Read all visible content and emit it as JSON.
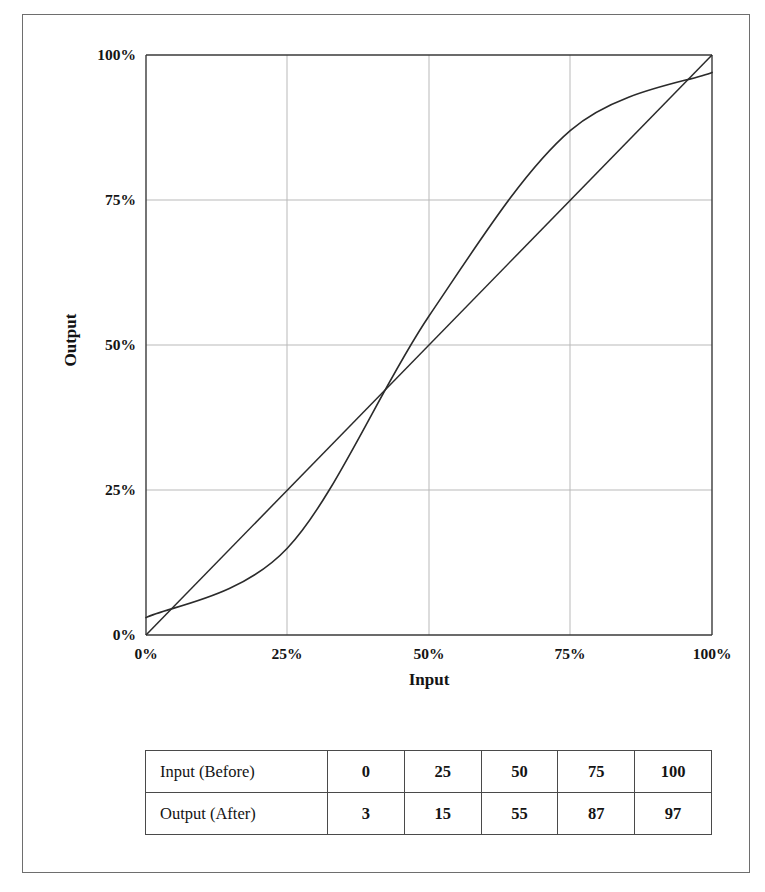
{
  "chart_data": {
    "type": "line",
    "title": "",
    "xlabel": "Input",
    "ylabel": "Output",
    "xlim": [
      0,
      100
    ],
    "ylim": [
      0,
      100
    ],
    "grid": true,
    "legend": "none",
    "x_tick_labels": [
      "0%",
      "25%",
      "50%",
      "75%",
      "100%"
    ],
    "y_tick_labels": [
      "0%",
      "25%",
      "50%",
      "75%",
      "100%"
    ],
    "x_ticks": [
      0,
      25,
      50,
      75,
      100
    ],
    "y_ticks": [
      0,
      25,
      50,
      75,
      100
    ],
    "series": [
      {
        "name": "Output (After)",
        "type": "s-curve",
        "x": [
          0,
          25,
          50,
          75,
          100
        ],
        "values": [
          3,
          15,
          55,
          87,
          97
        ]
      },
      {
        "name": "Reference (identity)",
        "type": "diagonal",
        "x": [
          0,
          100
        ],
        "values": [
          0,
          100
        ]
      }
    ]
  },
  "axes": {
    "y_title": "Output",
    "x_title": "Input",
    "y_tick_100": "100%",
    "y_tick_75": "75%",
    "y_tick_50": "50%",
    "y_tick_25": "25%",
    "y_tick_0": "0%",
    "x_tick_0": "0%",
    "x_tick_25": "25%",
    "x_tick_50": "50%",
    "x_tick_75": "75%",
    "x_tick_100": "100%"
  },
  "table": {
    "rows": [
      {
        "header": "Input (Before)",
        "cells": [
          "0",
          "25",
          "50",
          "75",
          "100"
        ]
      },
      {
        "header": "Output (After)",
        "cells": [
          "3",
          "15",
          "55",
          "87",
          "97"
        ]
      }
    ]
  },
  "colors": {
    "frame": "#6e6e6e",
    "axis": "#3a3a3a",
    "grid": "#b9b9b9",
    "curve": "#2b2b2b",
    "table_border": "#4a4a4a",
    "text": "#141414",
    "background": "#ffffff"
  }
}
